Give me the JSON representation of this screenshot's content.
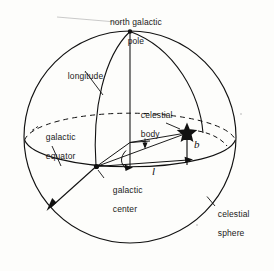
{
  "figure": {
    "labels": {
      "north_galactic_pole_line1": "north galactic",
      "north_galactic_pole_line2": "pole",
      "longitude": "longitude",
      "galactic_equator_line1": "galactic",
      "galactic_equator_line2": "equator",
      "celestial_body_line1": "celestial",
      "celestial_body_line2": "body",
      "galactic_center_line1": "galactic",
      "galactic_center_line2": "center",
      "celestial_sphere_line1": "celestial",
      "celestial_sphere_line2": "sphere",
      "latitude_symbol": "b",
      "longitude_symbol": "l"
    },
    "colors": {
      "stroke": "#111111",
      "background": "#fdfdfb",
      "text": "#1a1a1a"
    },
    "markers": {
      "celestial_body_icon": "star-marker",
      "north_galactic_pole_icon": "pole-dot",
      "galactic_center_icon": "center-dot"
    }
  }
}
